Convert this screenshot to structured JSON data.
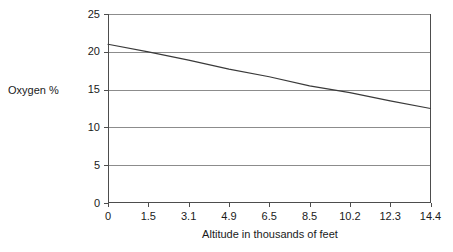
{
  "chart_data": {
    "type": "line",
    "title": "",
    "xlabel": "Altitude in thousands of feet",
    "ylabel": "Oxygen %",
    "categories": [
      "0",
      "1.5",
      "3.1",
      "4.9",
      "6.5",
      "8.5",
      "10.2",
      "12.3",
      "14.4"
    ],
    "x_tick_labels": [
      "0",
      "1.5",
      "3.1",
      "4.9",
      "6.5",
      "8.5",
      "10.2",
      "12.3",
      "14.4"
    ],
    "y_tick_labels": [
      "0",
      "5",
      "10",
      "15",
      "20",
      "25"
    ],
    "y_ticks": [
      0,
      5,
      10,
      15,
      20,
      25
    ],
    "ylim": [
      0,
      25
    ],
    "grid": "horizontal",
    "legend": "none",
    "series": [
      {
        "name": "Oxygen %",
        "values": [
          21.0,
          20.0,
          18.9,
          17.7,
          16.7,
          15.5,
          14.6,
          13.5,
          12.5
        ],
        "color": "#3a3a3a"
      }
    ],
    "axis_color": "#4d4d4d",
    "grid_color": "#8c8c8c",
    "background": "#ffffff"
  }
}
